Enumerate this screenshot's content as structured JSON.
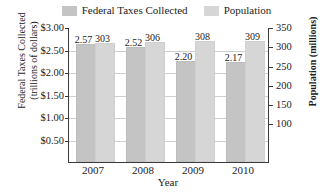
{
  "chart_data": {
    "type": "bar",
    "title": "",
    "categories": [
      "2007",
      "2008",
      "2009",
      "2010"
    ],
    "xlabel": "Year",
    "grid": true,
    "legend_position": "top-center",
    "series": [
      {
        "name": "Federal Taxes Collected",
        "axis": "left",
        "unit": "trillions of dollars",
        "color": "#c4c4c4",
        "values": [
          2.57,
          2.52,
          2.2,
          2.17
        ],
        "labels": [
          "2.57",
          "2.52",
          "2.20",
          "2.17"
        ]
      },
      {
        "name": "Population",
        "axis": "right",
        "unit": "millions",
        "color": "#d6d6d6",
        "values": [
          303,
          306,
          308,
          309
        ],
        "labels": [
          "303",
          "306",
          "308",
          "309"
        ]
      }
    ],
    "left_axis": {
      "label_line1": "Federal Taxes Collected",
      "label_line2": "(trillions of dollars)",
      "ticks": [
        "$3.00",
        "$2.50",
        "$2.00",
        "$1.50",
        "$1.00",
        "$0.50"
      ],
      "tick_values": [
        3.0,
        2.5,
        2.0,
        1.5,
        1.0,
        0.5
      ],
      "ylim": [
        0,
        3.0
      ]
    },
    "right_axis": {
      "label": "Population (millions)",
      "ticks": [
        "350",
        "300",
        "250",
        "200",
        "150",
        "100"
      ],
      "tick_values": [
        350,
        300,
        250,
        200,
        150,
        100
      ],
      "ylim": [
        0,
        350
      ]
    }
  },
  "legend": {
    "entries": [
      {
        "label": "Federal Taxes Collected",
        "color": "#c4c4c4"
      },
      {
        "label": "Population",
        "color": "#d6d6d6"
      }
    ]
  }
}
